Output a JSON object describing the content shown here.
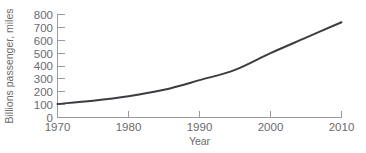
{
  "chart_data": {
    "type": "line",
    "title": "",
    "xlabel": "Year",
    "ylabel": "Billions passenger, miles",
    "xlim": [
      1970,
      2010
    ],
    "ylim": [
      0,
      800
    ],
    "grid": false,
    "legend": false,
    "series_color": "#3c3c42",
    "axis_color": "#9a9a9e",
    "x": [
      1970,
      1975,
      1980,
      1985,
      1990,
      1995,
      2000,
      2005,
      2010
    ],
    "series": [
      {
        "name": "Billions passenger, miles",
        "values": [
          105,
          130,
          165,
          215,
          290,
          370,
          500,
          620,
          740
        ]
      }
    ],
    "xticks": [
      {
        "value": 1970,
        "label": "1970"
      },
      {
        "value": 1980,
        "label": "1980"
      },
      {
        "value": 1990,
        "label": "1990"
      },
      {
        "value": 2000,
        "label": "2000"
      },
      {
        "value": 2010,
        "label": "2010"
      }
    ],
    "yticks": [
      {
        "value": 0,
        "label": "0"
      },
      {
        "value": 100,
        "label": "100"
      },
      {
        "value": 200,
        "label": "200"
      },
      {
        "value": 300,
        "label": "300"
      },
      {
        "value": 400,
        "label": "400"
      },
      {
        "value": 500,
        "label": "500"
      },
      {
        "value": 600,
        "label": "600"
      },
      {
        "value": 700,
        "label": "700"
      },
      {
        "value": 800,
        "label": "800"
      }
    ]
  },
  "labels": {
    "x_axis_title": "Year",
    "y_axis_title": "Billions passenger, miles",
    "ytick_0": "0",
    "ytick_100": "100",
    "ytick_200": "200",
    "ytick_300": "300",
    "ytick_400": "400",
    "ytick_500": "500",
    "ytick_600": "600",
    "ytick_700": "700",
    "ytick_800": "800",
    "xtick_1970": "1970",
    "xtick_1980": "1980",
    "xtick_1990": "1990",
    "xtick_2000": "2000",
    "xtick_2010": "2010"
  }
}
